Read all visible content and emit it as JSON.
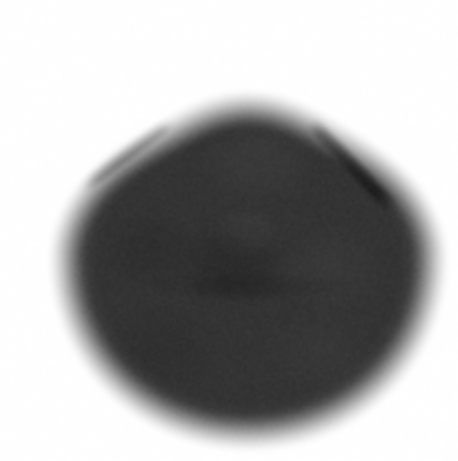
{
  "image": {
    "kind": "grayscale-scintigraphy-scan",
    "width": 458,
    "height": 461,
    "background_color": "#ffffff",
    "alt_text": "Grayscale nuclear medicine scan showing a pear-shaped dark uptake region with a pointed apex and two dark linear streaks"
  },
  "scan_data": {
    "type": "heatmap",
    "colormap": "grayscale-inverted",
    "background_value": 0,
    "blob": {
      "name": "primary-uptake-region",
      "center_x": 248,
      "center_y": 255,
      "radius_x": 185,
      "radius_y": 175,
      "apex_x": 255,
      "apex_y": 38,
      "bottom_y": 432,
      "left_edge_x": 62,
      "right_edge_x": 432,
      "interior_gray": "#343434",
      "edge_softness_px": 34,
      "shape": "pear"
    },
    "streaks": [
      {
        "name": "left-dark-streak",
        "x1": 172,
        "y1": 118,
        "x2": 76,
        "y2": 190,
        "thickness": 13,
        "darkness": 0.96,
        "blur": 5,
        "gray": "#070707"
      },
      {
        "name": "right-dark-streak",
        "x1": 308,
        "y1": 118,
        "x2": 396,
        "y2": 212,
        "thickness": 11,
        "darkness": 0.78,
        "blur": 6,
        "gray": "#141414"
      }
    ],
    "mottles": [
      {
        "name": "mottle-upper-center",
        "x": 258,
        "y": 160,
        "rx": 62,
        "ry": 46,
        "delta": 0.05
      },
      {
        "name": "mottle-center-dark",
        "x": 232,
        "y": 262,
        "rx": 58,
        "ry": 48,
        "delta": -0.07
      },
      {
        "name": "mottle-center-light",
        "x": 246,
        "y": 232,
        "rx": 36,
        "ry": 28,
        "delta": 0.06
      },
      {
        "name": "mottle-left-mid",
        "x": 150,
        "y": 250,
        "rx": 52,
        "ry": 44,
        "delta": -0.04
      },
      {
        "name": "mottle-right-mid",
        "x": 330,
        "y": 270,
        "rx": 56,
        "ry": 48,
        "delta": 0.04
      },
      {
        "name": "mottle-lower-left",
        "x": 160,
        "y": 350,
        "rx": 64,
        "ry": 50,
        "delta": -0.03
      },
      {
        "name": "mottle-lower-right",
        "x": 320,
        "y": 350,
        "rx": 58,
        "ry": 46,
        "delta": 0.03
      },
      {
        "name": "mottle-band-horizontal",
        "x": 252,
        "y": 286,
        "rx": 120,
        "ry": 16,
        "delta": -0.05
      }
    ],
    "noise": {
      "name": "film-grain",
      "amplitude": 13,
      "grain_size": 1
    }
  }
}
